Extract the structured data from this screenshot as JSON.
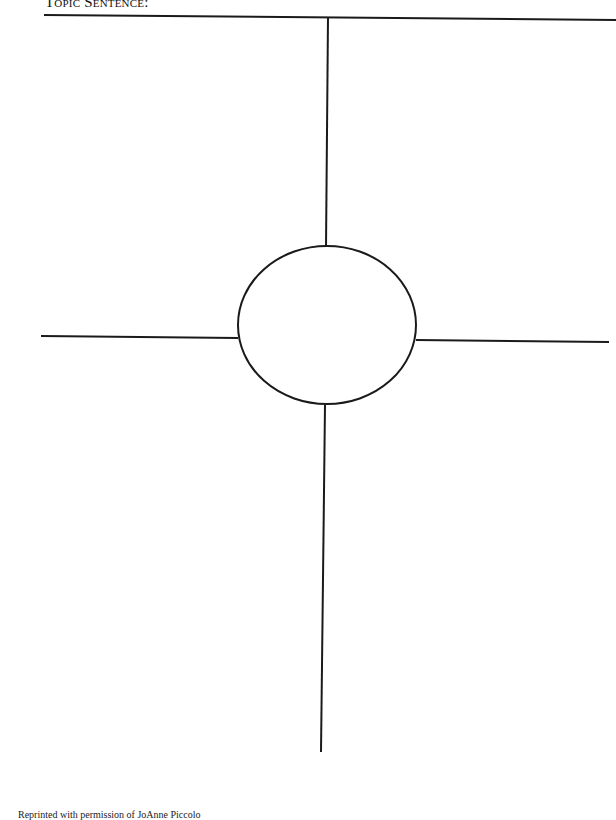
{
  "header": {
    "title": "Topic Sentence:"
  },
  "diagram": {
    "type": "four-square organizer",
    "center_shape": "circle",
    "quadrants": [
      "top-left",
      "top-right",
      "bottom-left",
      "bottom-right"
    ],
    "line_color": "#1a1a1a"
  },
  "footer": {
    "credit": "Reprinted with permission of JoAnne Piccolo"
  }
}
